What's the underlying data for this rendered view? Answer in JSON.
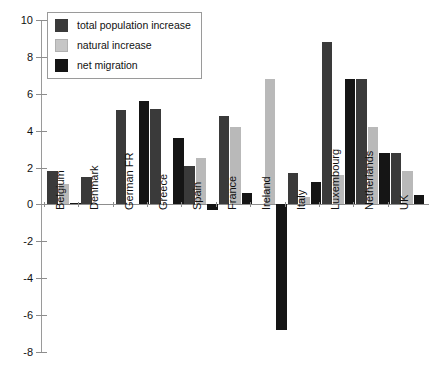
{
  "chart_data": {
    "type": "bar",
    "title": "",
    "xlabel": "",
    "ylabel": "",
    "ylim": [
      -8,
      10
    ],
    "ytick_step": 2,
    "yticks": [
      10,
      8,
      6,
      4,
      2,
      0,
      -2,
      -4,
      -6,
      -8
    ],
    "grid": false,
    "legend_position": "top-left",
    "categories": [
      "Belgium",
      "Denmark",
      "German FR",
      "Greece",
      "Spain",
      "France",
      "Ireland",
      "Italy",
      "Luxembourg",
      "Netherlands",
      "UK"
    ],
    "series": [
      {
        "name": "total population increase",
        "color": "#3a3a3a",
        "values": [
          1.8,
          1.5,
          5.1,
          5.2,
          2.1,
          4.8,
          0.0,
          1.7,
          8.8,
          6.8,
          2.8
        ]
      },
      {
        "name": "natural increase",
        "color": "#b9b9b9",
        "values": [
          1.1,
          0.0,
          0.0,
          0.0,
          2.5,
          4.2,
          6.8,
          0.4,
          1.6,
          4.2,
          1.8
        ]
      },
      {
        "name": "net migration",
        "color": "#151515",
        "values": [
          0.1,
          0.0,
          5.6,
          3.6,
          -0.3,
          0.6,
          -6.8,
          1.2,
          6.8,
          2.8,
          0.5
        ]
      }
    ]
  },
  "legend": {
    "items": [
      {
        "label": "total population increase",
        "swatch": "total"
      },
      {
        "label": "natural increase",
        "swatch": "natural"
      },
      {
        "label": "net migration",
        "swatch": "migration"
      }
    ]
  }
}
